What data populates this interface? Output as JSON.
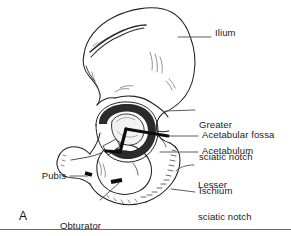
{
  "figure": {
    "panel_letter": "A",
    "background_color": "#ffffff",
    "ink_color": "#1a1a1a",
    "line_color": "#555555"
  },
  "labels": [
    {
      "id": "ilium",
      "text": "Ilium",
      "lines": [
        "Ilium"
      ],
      "side": "right",
      "text_x": 215,
      "text_y": 33,
      "leader": {
        "x1": 211,
        "y1": 37,
        "x2": 178,
        "y2": 37
      }
    },
    {
      "id": "greater-sciatic-notch",
      "text": "Greater sciatic notch",
      "lines": [
        "Greater",
        "sciatic notch"
      ],
      "side": "right",
      "text_x": 199,
      "text_y": 104,
      "leader": {
        "x1": 195,
        "y1": 110,
        "x2": 166,
        "y2": 110
      }
    },
    {
      "id": "acetabular-fossa",
      "text": "Acetabular fossa",
      "lines": [
        "Acetabular fossa"
      ],
      "side": "right",
      "text_x": 202,
      "text_y": 131,
      "leader": {
        "x1": 198,
        "y1": 136,
        "x2": 168,
        "y2": 136
      }
    },
    {
      "id": "acetabulum",
      "text": "Acetabulum",
      "lines": [
        "Acetabulum"
      ],
      "side": "right",
      "text_x": 202,
      "text_y": 147,
      "leader": {
        "x1": 198,
        "y1": 152,
        "x2": 160,
        "y2": 152
      }
    },
    {
      "id": "lesser-sciatic-notch",
      "text": "Lesser sciatic notch",
      "lines": [
        "Lesser",
        "sciatic notch"
      ],
      "side": "right",
      "text_x": 198,
      "text_y": 160,
      "leader": {
        "x1": 194,
        "y1": 165,
        "x2": 176,
        "y2": 170
      }
    },
    {
      "id": "ischium",
      "text": "Ischium",
      "lines": [
        "Ischium"
      ],
      "side": "right",
      "text_x": 199,
      "text_y": 188,
      "leader": {
        "x1": 195,
        "y1": 193,
        "x2": 172,
        "y2": 189
      }
    },
    {
      "id": "pubis",
      "text": "Pubis",
      "lines": [
        "Pubis"
      ],
      "side": "left",
      "text_x": 41,
      "text_y": 172,
      "leader": {
        "x1": 70,
        "y1": 177,
        "x2": 86,
        "y2": 177
      }
    },
    {
      "id": "obturator-foramen",
      "text": "Obturator foramen",
      "lines": [
        "Obturator",
        "foramen"
      ],
      "side": "left",
      "text_x": 60,
      "text_y": 203,
      "leader": {
        "x1": 101,
        "y1": 203,
        "x2": 118,
        "y2": 184
      }
    }
  ]
}
